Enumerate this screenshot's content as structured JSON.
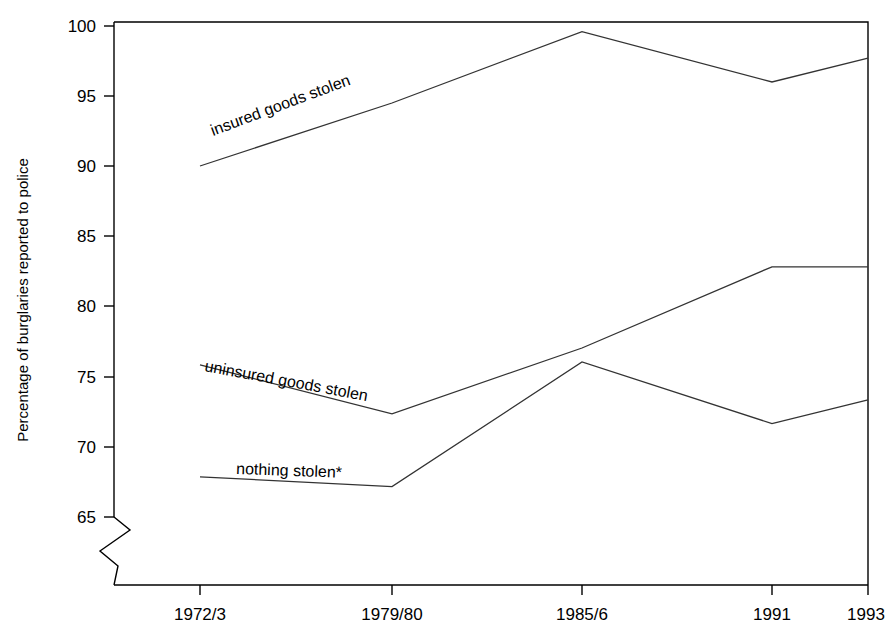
{
  "chart_data": {
    "type": "line",
    "title": "",
    "xlabel": "",
    "ylabel": "Percentage of burglaries reported to police",
    "categories": [
      "1972/3",
      "1979/80",
      "1985/6",
      "1991",
      "1993"
    ],
    "ylim": [
      65,
      100
    ],
    "yticks": [
      65,
      70,
      75,
      80,
      85,
      90,
      95,
      100
    ],
    "ytick_labels": [
      "65",
      "70",
      "75",
      "80",
      "85",
      "90",
      "95",
      "100"
    ],
    "axis_break": "y-axis broken below 65",
    "grid": "off",
    "legend_position": "inline labels along lines",
    "series": [
      {
        "name": "insured goods stolen",
        "label": "insured goods stolen",
        "values": [
          90.0,
          94.5,
          99.6,
          96.0,
          97.7
        ]
      },
      {
        "name": "uninsured goods stolen",
        "label": "uninsured goods stolen",
        "values": [
          75.8,
          72.3,
          77.0,
          82.8,
          82.8
        ]
      },
      {
        "name": "nothing stolen",
        "label": "nothing stolen*",
        "values": [
          67.8,
          67.1,
          76.0,
          71.6,
          73.3
        ]
      }
    ]
  },
  "axis": {
    "y_title": "Percentage of burglaries reported to police",
    "ticks_y": [
      "100",
      "95",
      "90",
      "85",
      "80",
      "75",
      "70",
      "65"
    ],
    "ticks_x": [
      "1972/3",
      "1979/80",
      "1985/6",
      "1991",
      "1993"
    ]
  },
  "series_labels": {
    "insured": "insured goods stolen",
    "uninsured": "uninsured goods stolen",
    "nothing": "nothing stolen*"
  },
  "colors": {
    "line": "#333333",
    "axis": "#000000",
    "background": "#ffffff"
  }
}
